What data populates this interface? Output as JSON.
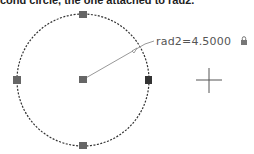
{
  "caption": "cond circle, the one attached to rad2.",
  "drawing": {
    "circle": {
      "cx": 83,
      "cy": 80,
      "r": 66,
      "stroke": "#333333",
      "style": "dashed"
    },
    "grips": [
      {
        "name": "grip-center",
        "x": 83,
        "y": 80
      },
      {
        "name": "grip-top",
        "x": 83,
        "y": 14
      },
      {
        "name": "grip-bottom",
        "x": 83,
        "y": 146
      },
      {
        "name": "grip-left",
        "x": 17,
        "y": 80
      },
      {
        "name": "grip-right",
        "x": 149,
        "y": 80
      }
    ],
    "grip_color": "#666666",
    "dimension": {
      "label": "rad2=4.5000",
      "locked": true,
      "color": "#777777"
    },
    "crosshair": {
      "x": 209,
      "y": 80
    }
  }
}
